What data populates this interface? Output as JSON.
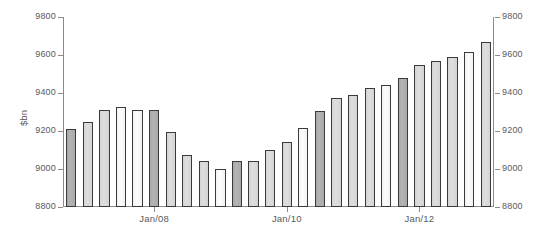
{
  "chart_data": {
    "type": "bar",
    "title": "",
    "subtitle": "",
    "xlabel": "",
    "ylabel": "$bn",
    "ylim": [
      8800,
      9800
    ],
    "grid": false,
    "legend": null,
    "y_ticks": [
      8800,
      9000,
      9200,
      9400,
      9600,
      9800
    ],
    "y_tick_labels": [
      "8800",
      "9000",
      "9200",
      "9400",
      "9600",
      "9800"
    ],
    "right_axis": true,
    "right_y_tick_labels": [
      "8800",
      "9000",
      "9200",
      "9400",
      "9600",
      "9800"
    ],
    "x_tick_labels": [
      "Jan/08",
      "Jan/10",
      "Jan/12"
    ],
    "x_tick_positions": [
      5,
      13,
      21
    ],
    "categories": [
      "Q3/06",
      "Q4/06",
      "Q1/07",
      "Q2/07",
      "Q3/07",
      "Q4/07",
      "Q1/08",
      "Q2/08",
      "Q3/08",
      "Q4/08",
      "Q1/09",
      "Q2/09",
      "Q3/09",
      "Q4/09",
      "Q1/10",
      "Q2/10",
      "Q3/10",
      "Q4/10",
      "Q1/11",
      "Q2/11",
      "Q3/11",
      "Q4/11",
      "Q1/12",
      "Q2/12",
      "Q3/12",
      "Q4/12"
    ],
    "values": [
      9210,
      9247,
      9310,
      9325,
      9310,
      9310,
      9196,
      9072,
      9040,
      8998,
      9044,
      9044,
      9100,
      9140,
      9215,
      9307,
      9375,
      9392,
      9425,
      9440,
      9480,
      9545,
      9570,
      9592,
      9617,
      9667
    ],
    "bar_shades": [
      "dark",
      "mid",
      "mid",
      "light",
      "light",
      "dark",
      "mid",
      "mid",
      "mid",
      "light",
      "dark",
      "mid",
      "mid",
      "mid",
      "light",
      "dark",
      "mid",
      "mid",
      "mid",
      "light",
      "dark",
      "mid",
      "mid",
      "mid",
      "light",
      "mid"
    ]
  },
  "colors": {
    "bar_dark": "#a9a9a9",
    "bar_mid": "#d4d4d4",
    "bar_light": "#f2f2f2",
    "bar_edge": "#3a3a3c",
    "axis": "#8b8b8d",
    "text": "#59595b",
    "background": "#ffffff"
  }
}
